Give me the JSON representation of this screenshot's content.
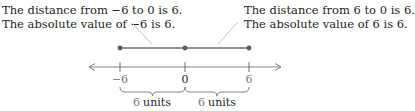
{
  "annotations": {
    "left": {
      "line1": "The distance from −6 to 0 is 6.",
      "line2": "The absolute value of −6 is 6."
    },
    "right": {
      "line1": "The distance from 6 to 0 is 6.",
      "line2": "The absolute value of 6 is 6."
    }
  },
  "number_line": {
    "ticks": [
      {
        "value": -6,
        "label": "−6"
      },
      {
        "value": 0,
        "label": "0"
      },
      {
        "value": 6,
        "label": "6"
      }
    ],
    "points": [
      -6,
      0,
      6
    ],
    "braces": [
      {
        "from": -6,
        "to": 0,
        "num": "6",
        "unit": "units"
      },
      {
        "from": 0,
        "to": 6,
        "num": "6",
        "unit": "units"
      }
    ]
  },
  "colors": {
    "line": "#808080",
    "segment": "#6d6e71",
    "point": "#58595b",
    "text": "#231f20",
    "muted_text": "#7a7a7a",
    "leader": "#bcbec0"
  }
}
